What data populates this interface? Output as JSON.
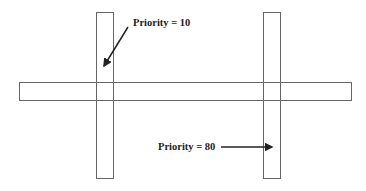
{
  "diagram": {
    "horizontal_layer": {
      "x": 19,
      "y": 82,
      "width": 333,
      "height": 19
    },
    "vertical_layers": [
      {
        "name": "left",
        "x": 96,
        "y": 12,
        "width": 18,
        "height": 167
      },
      {
        "name": "right",
        "x": 263,
        "y": 12,
        "width": 18,
        "height": 167
      }
    ],
    "annotations": [
      {
        "label": "Priority = 10",
        "x": 133,
        "y": 17,
        "arrow": {
          "from": [
            128,
            27
          ],
          "to": [
            104,
            66
          ]
        }
      },
      {
        "label": "Priority = 80",
        "x": 158,
        "y": 141,
        "arrow": {
          "from": [
            221,
            147
          ],
          "to": [
            272,
            147
          ]
        }
      }
    ],
    "line_color": "#666666",
    "arrow_color": "#222222"
  }
}
